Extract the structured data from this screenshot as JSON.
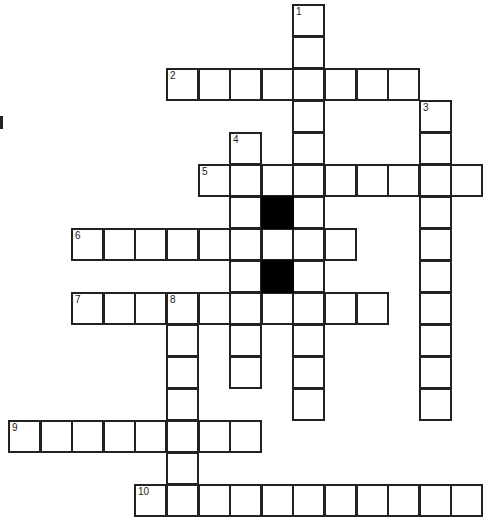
{
  "puzzle": {
    "type": "crossword",
    "cell_size": 31.6,
    "origin": {
      "x": 8,
      "y": 4
    },
    "colors": {
      "line": "#222222",
      "block": "#000000",
      "background": "#ffffff"
    },
    "words": [
      {
        "number": "1",
        "direction": "down",
        "row": 0,
        "col": 9,
        "length": 13
      },
      {
        "number": "2",
        "direction": "across",
        "row": 2,
        "col": 5,
        "length": 8
      },
      {
        "number": "3",
        "direction": "down",
        "row": 3,
        "col": 13,
        "length": 10
      },
      {
        "number": "4",
        "direction": "down",
        "row": 4,
        "col": 7,
        "length": 8
      },
      {
        "number": "5",
        "direction": "across",
        "row": 5,
        "col": 6,
        "length": 9
      },
      {
        "number": "6",
        "direction": "across",
        "row": 7,
        "col": 2,
        "length": 9
      },
      {
        "number": "7",
        "direction": "across",
        "row": 9,
        "col": 2,
        "length": 10
      },
      {
        "number": "8",
        "direction": "down",
        "row": 9,
        "col": 5,
        "length": 7
      },
      {
        "number": "9",
        "direction": "across",
        "row": 13,
        "col": 0,
        "length": 8
      },
      {
        "number": "10",
        "direction": "across",
        "row": 15,
        "col": 4,
        "length": 11
      }
    ],
    "black_cells": [
      {
        "row": 6,
        "col": 8
      },
      {
        "row": 8,
        "col": 8
      }
    ]
  }
}
